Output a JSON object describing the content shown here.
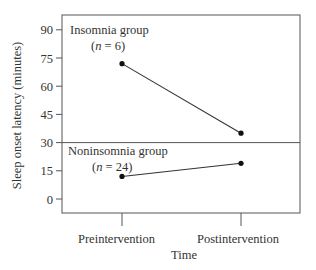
{
  "chart_data": {
    "type": "line",
    "title": "",
    "xlabel": "Time",
    "ylabel": "Sleep onset latency (minutes)",
    "categories": [
      "Preintervention",
      "Postintervention"
    ],
    "yticks": [
      0,
      15,
      30,
      45,
      60,
      75,
      90
    ],
    "ylim": [
      -8,
      98
    ],
    "grid": false,
    "divider_at": 30,
    "series": [
      {
        "name": "Insomnia group",
        "n_label": "(n = 6)",
        "values": [
          72,
          35
        ]
      },
      {
        "name": "Noninsomnia group",
        "n_label": "(n = 24)",
        "values": [
          12,
          19
        ]
      }
    ],
    "annotations": [
      {
        "text": "Insomnia group",
        "sub": "(n = 6)"
      },
      {
        "text": "Noninsomnia group",
        "sub": "(n = 24)"
      }
    ]
  },
  "labels": {
    "xlabel": "Time",
    "ylabel": "Sleep onset latency (minutes)",
    "cat0": "Preintervention",
    "cat1": "Postintervention",
    "ins_name": "Insomnia group",
    "ins_n_pre": "(",
    "ins_n_var": "n",
    "ins_n_post": " = 6)",
    "non_name": "Noninsomnia group",
    "non_n_pre": "(",
    "non_n_var": "n",
    "non_n_post": " = 24)"
  },
  "colors": {
    "line": "#333333",
    "frame": "#555555"
  }
}
